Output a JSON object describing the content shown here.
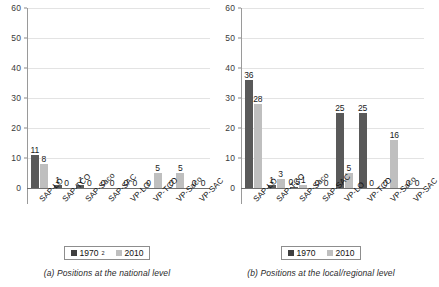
{
  "chart_data": [
    {
      "type": "bar",
      "panel": "a",
      "title": "",
      "caption": "(a) Positions at the national level",
      "categories": [
        "SAP-LO",
        "SAP-TCO",
        "SAP-Saco",
        "SAP-SAC",
        "VP-LO",
        "VP-TCO",
        "VP-Saco",
        "VP-SAC"
      ],
      "series": [
        {
          "name": "1970",
          "footnote_marker": "2",
          "color": "#595959",
          "values": [
            11,
            1,
            1,
            0,
            0,
            0,
            0,
            0
          ]
        },
        {
          "name": "2010",
          "footnote_marker": "",
          "color": "#bfbfbf",
          "values": [
            8,
            0,
            0,
            0,
            0,
            5,
            5,
            0
          ]
        }
      ],
      "value_labels": [
        [
          "11",
          "1",
          "1",
          "0",
          "0",
          "0",
          "0",
          "0"
        ],
        [
          "8",
          "0",
          "0",
          "0",
          "0",
          "5",
          "5",
          "0"
        ]
      ],
      "xlabel": "",
      "ylabel": "",
      "ylim": [
        0,
        60
      ],
      "yticks": [
        0,
        10,
        20,
        30,
        40,
        50,
        60
      ],
      "ytick_labels": [
        "0",
        "10",
        "20",
        "30",
        "40",
        "50",
        "60"
      ],
      "grid": true,
      "legend_position": "bottom"
    },
    {
      "type": "bar",
      "panel": "b",
      "title": "",
      "caption": "(b) Positions at the local/regional level",
      "categories": [
        "SAP-LO",
        "SAP-TCO",
        "SAP-Saco",
        "SAP-SAC",
        "VP-LO",
        "VP-TCO",
        "VP-Saco",
        "VP-SAC"
      ],
      "series": [
        {
          "name": "1970",
          "footnote_marker": "",
          "color": "#595959",
          "values": [
            36,
            1,
            0.5,
            0,
            25,
            25,
            0,
            0
          ]
        },
        {
          "name": "2010",
          "footnote_marker": "",
          "color": "#bfbfbf",
          "values": [
            28,
            3,
            1,
            0,
            5,
            0,
            16,
            0
          ]
        }
      ],
      "value_labels": [
        [
          "36",
          "1",
          "0.5",
          "0",
          "25",
          "25",
          "0",
          "0"
        ],
        [
          "28",
          "3",
          "1",
          "0",
          "5",
          "0",
          "16",
          "0"
        ]
      ],
      "xlabel": "",
      "ylabel": "",
      "ylim": [
        0,
        60
      ],
      "yticks": [
        0,
        10,
        20,
        30,
        40,
        50,
        60
      ],
      "ytick_labels": [
        "0",
        "10",
        "20",
        "30",
        "40",
        "50",
        "60"
      ],
      "grid": true,
      "legend_position": "bottom"
    }
  ],
  "colors": {
    "series_1970": "#595959",
    "series_2010": "#bfbfbf",
    "gridline": "#e3e3e3",
    "axis": "#6f6f6f",
    "background": "#ffffff"
  }
}
